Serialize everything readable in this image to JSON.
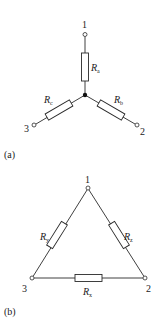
{
  "figure": {
    "star": {
      "caption": "(a)",
      "terminals": [
        {
          "id": "1",
          "label": "1"
        },
        {
          "id": "2",
          "label": "2"
        },
        {
          "id": "3",
          "label": "3"
        }
      ],
      "resistors": [
        {
          "id": "Ra",
          "symbol": "R",
          "subscript": "a",
          "between": [
            "node",
            "1"
          ]
        },
        {
          "id": "Rb",
          "symbol": "R",
          "subscript": "b",
          "between": [
            "node",
            "2"
          ]
        },
        {
          "id": "Rc",
          "symbol": "R",
          "subscript": "c",
          "between": [
            "node",
            "3"
          ]
        }
      ]
    },
    "delta": {
      "caption": "(b)",
      "terminals": [
        {
          "id": "1",
          "label": "1"
        },
        {
          "id": "2",
          "label": "2"
        },
        {
          "id": "3",
          "label": "3"
        }
      ],
      "resistors": [
        {
          "id": "Rx",
          "symbol": "R",
          "subscript": "x",
          "between": [
            "3",
            "2"
          ]
        },
        {
          "id": "Ry",
          "symbol": "R",
          "subscript": "y",
          "between": [
            "1",
            "3"
          ]
        },
        {
          "id": "Rz",
          "symbol": "R",
          "subscript": "z",
          "between": [
            "1",
            "2"
          ]
        }
      ]
    },
    "colors": {
      "line": "#2a2a2a",
      "background": "#ffffff"
    }
  }
}
